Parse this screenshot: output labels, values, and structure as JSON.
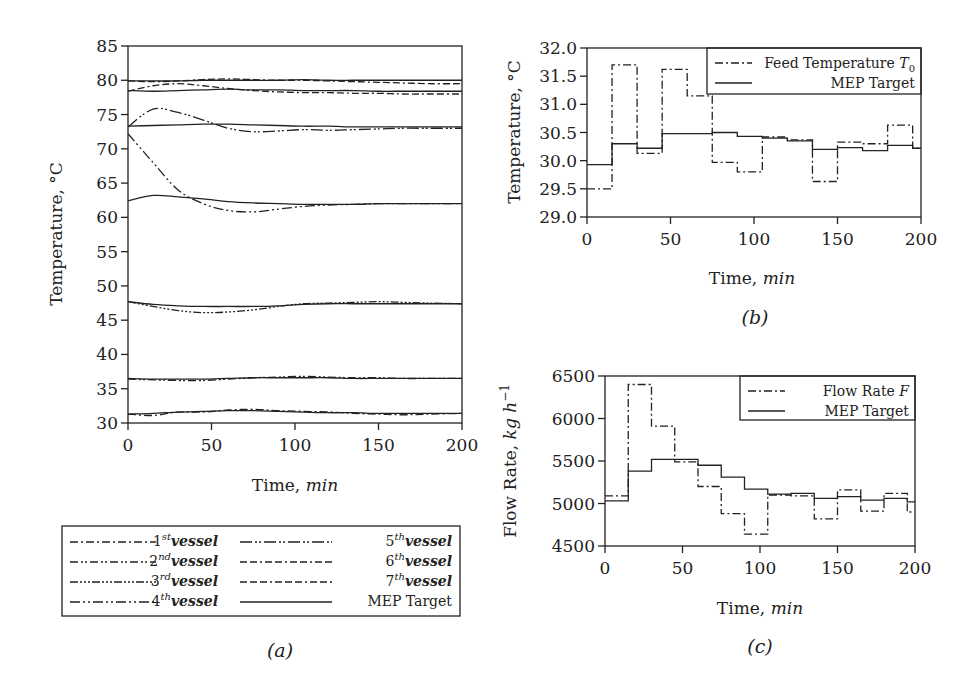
{
  "figure": {
    "captions": {
      "a": "(a)",
      "b": "(b)",
      "c": "(c)"
    }
  },
  "chart_data": [
    {
      "id": "a",
      "type": "line",
      "title": "",
      "xlabel": "Time, min",
      "ylabel": "Temperature, °C",
      "xlim": [
        0,
        200
      ],
      "ylim": [
        30,
        85
      ],
      "xticks": [
        0,
        50,
        100,
        150,
        200
      ],
      "yticks": [
        30,
        35,
        40,
        45,
        50,
        55,
        60,
        65,
        70,
        75,
        80,
        85
      ],
      "grid": false,
      "legend_position": "below",
      "x": [
        0,
        15,
        30,
        45,
        60,
        75,
        90,
        105,
        120,
        135,
        150,
        165,
        180,
        200
      ],
      "series": [
        {
          "name": "1st vessel",
          "sup": "st",
          "num": "1",
          "dash": "8 3 2 3",
          "values": [
            31.3,
            31.1,
            31.6,
            31.6,
            31.9,
            32.0,
            31.8,
            31.7,
            31.6,
            31.4,
            31.3,
            31.2,
            31.3,
            31.4
          ]
        },
        {
          "name": "2nd vessel",
          "sup": "nd",
          "num": "2",
          "dash": "8 3 2 2 2 3",
          "values": [
            36.4,
            36.3,
            36.2,
            36.2,
            36.4,
            36.6,
            36.7,
            36.8,
            36.7,
            36.6,
            36.6,
            36.5,
            36.5,
            36.5
          ]
        },
        {
          "name": "3rd vessel",
          "sup": "rd",
          "num": "3",
          "dash": "8 2 2 2 2 2 2 2",
          "values": [
            47.7,
            47.0,
            46.4,
            46.1,
            46.2,
            46.5,
            47.0,
            47.4,
            47.5,
            47.6,
            47.7,
            47.6,
            47.5,
            47.4
          ]
        },
        {
          "name": "4th vessel",
          "sup": "th",
          "num": "4",
          "dash": "10 3 2 3 2 3",
          "values": [
            72.2,
            68.0,
            64.0,
            62.0,
            61.0,
            60.8,
            61.2,
            61.6,
            61.8,
            61.9,
            62.0,
            62.0,
            62.0,
            62.0
          ]
        },
        {
          "name": "5th vessel",
          "sup": "th",
          "num": "5",
          "dash": "12 3 2 2 2 3",
          "values": [
            73.2,
            75.8,
            75.3,
            74.2,
            73.0,
            72.5,
            72.6,
            72.8,
            72.7,
            72.8,
            72.9,
            73.0,
            73.0,
            73.0
          ]
        },
        {
          "name": "6th vessel",
          "sup": "th",
          "num": "6",
          "dash": "7 3 7 3 2 3",
          "values": [
            78.4,
            79.2,
            79.5,
            79.2,
            78.8,
            78.5,
            78.3,
            78.2,
            78.2,
            78.1,
            78.1,
            78.0,
            78.0,
            78.0
          ]
        },
        {
          "name": "7th vessel",
          "sup": "th",
          "num": "7",
          "dash": "7 3 7 3 7 3 2 3",
          "values": [
            79.9,
            79.8,
            79.9,
            80.1,
            80.2,
            80.1,
            80.0,
            80.0,
            79.9,
            79.8,
            79.7,
            79.6,
            79.5,
            79.5
          ]
        },
        {
          "name": "MEP Target 1",
          "dash": "",
          "values": [
            31.3,
            31.4,
            31.6,
            31.7,
            31.8,
            31.8,
            31.7,
            31.6,
            31.5,
            31.5,
            31.4,
            31.4,
            31.4,
            31.4
          ]
        },
        {
          "name": "MEP Target 2",
          "dash": "",
          "values": [
            36.5,
            36.4,
            36.4,
            36.4,
            36.5,
            36.6,
            36.6,
            36.6,
            36.6,
            36.5,
            36.5,
            36.5,
            36.5,
            36.5
          ]
        },
        {
          "name": "MEP Target 3",
          "dash": "",
          "values": [
            47.7,
            47.3,
            47.1,
            47.0,
            47.0,
            47.0,
            47.1,
            47.3,
            47.4,
            47.4,
            47.4,
            47.4,
            47.4,
            47.4
          ]
        },
        {
          "name": "MEP Target 4",
          "dash": "",
          "values": [
            62.4,
            63.2,
            63.0,
            62.7,
            62.3,
            62.1,
            62.0,
            61.9,
            61.9,
            61.9,
            62.0,
            62.0,
            62.0,
            62.0
          ]
        },
        {
          "name": "MEP Target 5",
          "dash": "",
          "values": [
            73.3,
            73.4,
            73.5,
            73.6,
            73.6,
            73.5,
            73.4,
            73.3,
            73.3,
            73.2,
            73.2,
            73.2,
            73.2,
            73.2
          ]
        },
        {
          "name": "MEP Target 6",
          "dash": "",
          "values": [
            78.5,
            78.4,
            78.5,
            78.6,
            78.7,
            78.6,
            78.6,
            78.5,
            78.5,
            78.5,
            78.4,
            78.4,
            78.4,
            78.4
          ]
        },
        {
          "name": "MEP Target 7",
          "dash": "",
          "values": [
            79.9,
            79.9,
            79.9,
            80.0,
            80.0,
            80.0,
            80.0,
            80.1,
            80.0,
            80.0,
            80.0,
            80.0,
            80.0,
            80.0
          ]
        }
      ],
      "legend": [
        {
          "label_num": "1",
          "label_sup": "st",
          "label_text": "vessel",
          "dash": "8 3 2 3"
        },
        {
          "label_num": "2",
          "label_sup": "nd",
          "label_text": "vessel",
          "dash": "8 3 2 2 2 3"
        },
        {
          "label_num": "3",
          "label_sup": "rd",
          "label_text": "vessel",
          "dash": "8 2 2 2 2 2 2 2"
        },
        {
          "label_num": "4",
          "label_sup": "th",
          "label_text": "vessel",
          "dash": "10 3 2 3 2 3"
        },
        {
          "label_num": "5",
          "label_sup": "th",
          "label_text": "vessel",
          "dash": "12 3 2 2 2 3"
        },
        {
          "label_num": "6",
          "label_sup": "th",
          "label_text": "vessel",
          "dash": "7 3 7 3 2 3"
        },
        {
          "label_num": "7",
          "label_sup": "th",
          "label_text": "vessel",
          "dash": "7 3 7 3 7 3 2 3"
        },
        {
          "label_num": "",
          "label_sup": "",
          "label_text": "MEP Target",
          "dash": ""
        }
      ]
    },
    {
      "id": "b",
      "type": "line",
      "step": true,
      "title": "",
      "xlabel": "Time, min",
      "ylabel": "Temperature, °C",
      "xlim": [
        0,
        200
      ],
      "ylim": [
        29.0,
        32.0
      ],
      "xticks": [
        0,
        50,
        100,
        150,
        200
      ],
      "yticks": [
        29.0,
        29.5,
        30.0,
        30.5,
        31.0,
        31.5,
        32.0
      ],
      "ytick_labels": [
        "29.0",
        "29.5",
        "30.0",
        "30.5",
        "31.0",
        "31.5",
        "32.0"
      ],
      "grid": false,
      "legend_position": "upper right",
      "x_edges": [
        0,
        15,
        30,
        45,
        60,
        75,
        90,
        105,
        120,
        135,
        150,
        165,
        180,
        195,
        200
      ],
      "series": [
        {
          "name": "Feed Temperature T0",
          "legend_label": "Feed Temperature T",
          "legend_sub": "0",
          "dash": "8 3 2 3",
          "values": [
            29.5,
            31.7,
            30.13,
            31.62,
            31.15,
            29.97,
            29.8,
            30.42,
            30.37,
            29.63,
            30.33,
            30.3,
            30.63,
            30.22
          ]
        },
        {
          "name": "MEP Target",
          "legend_label": "MEP Target",
          "legend_sub": "",
          "dash": "",
          "values": [
            29.93,
            30.3,
            30.22,
            30.48,
            30.48,
            30.5,
            30.43,
            30.4,
            30.35,
            30.2,
            30.23,
            30.18,
            30.27,
            30.22
          ]
        }
      ]
    },
    {
      "id": "c",
      "type": "line",
      "step": true,
      "title": "",
      "xlabel": "Time, min",
      "ylabel": "Flow Rate, kg h^-1",
      "xlim": [
        0,
        200
      ],
      "ylim": [
        4500,
        6500
      ],
      "xticks": [
        0,
        50,
        100,
        150,
        200
      ],
      "yticks": [
        4500,
        5000,
        5500,
        6000,
        6500
      ],
      "ytick_labels": [
        "4500",
        "5000",
        "5500",
        "6000",
        "6500"
      ],
      "grid": false,
      "legend_position": "upper right",
      "x_edges": [
        0,
        15,
        30,
        45,
        60,
        75,
        90,
        105,
        120,
        135,
        150,
        165,
        180,
        195,
        200
      ],
      "series": [
        {
          "name": "Flow Rate F",
          "legend_label": "Flow Rate F",
          "legend_sub": "",
          "dash": "8 3 2 3",
          "values": [
            5090,
            6400,
            5910,
            5490,
            5200,
            4880,
            4640,
            5100,
            5090,
            4820,
            5160,
            4910,
            5120,
            4900
          ]
        },
        {
          "name": "MEP Target",
          "legend_label": "MEP Target",
          "legend_sub": "",
          "dash": "",
          "values": [
            5030,
            5380,
            5520,
            5520,
            5450,
            5310,
            5170,
            5110,
            5120,
            5060,
            5080,
            5040,
            5060,
            5020
          ]
        }
      ]
    }
  ]
}
